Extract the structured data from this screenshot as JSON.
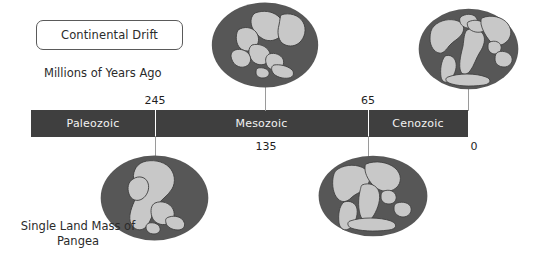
{
  "title_box": {
    "label": "Continental Drift"
  },
  "axis": {
    "caption": "Millions of Years Ago",
    "bar_color": "#3f3f3f",
    "divider_color": "#ffffff",
    "eras": [
      {
        "name": "Paleozoic"
      },
      {
        "name": "Mesozoic"
      },
      {
        "name": "Cenozoic"
      }
    ],
    "ticks": [
      {
        "value": "245",
        "position": "above"
      },
      {
        "value": "65",
        "position": "above"
      },
      {
        "value": "135",
        "position": "below"
      },
      {
        "value": "0",
        "position": "below"
      }
    ]
  },
  "globes": [
    {
      "id": "globe-top-left",
      "caption": ""
    },
    {
      "id": "globe-top-right",
      "caption": ""
    },
    {
      "id": "globe-bottom-left",
      "caption": "Single Land Mass of\nPangea"
    },
    {
      "id": "globe-bottom-right",
      "caption": ""
    }
  ],
  "captions": {
    "pangea_line1": "Single Land Mass of",
    "pangea_line2": "Pangea"
  },
  "colors": {
    "ocean": "#575757",
    "land": "#c8c8c8",
    "land_outline": "#3a3a3a",
    "bar": "#3f3f3f",
    "text": "#2b2b2b",
    "bar_text": "#f2f2f2",
    "connector": "#9a9a9a"
  }
}
